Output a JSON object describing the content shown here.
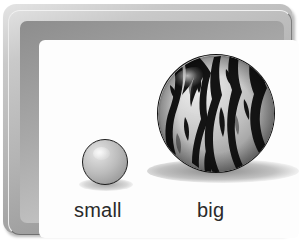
{
  "card": {
    "title": "size comparison card",
    "frame_color": "#b4b4b4",
    "canvas_color": "#fdfdfd"
  },
  "items": [
    {
      "id": "small-ball",
      "label": "small",
      "object_name": "plain grey ball",
      "fill_color": "#bcbcbc",
      "outline_color": "#1d1d1d",
      "diameter_px": 46
    },
    {
      "id": "big-ball",
      "label": "big",
      "object_name": "watermelon striped ball",
      "fill_color": "#b9b9b9",
      "stripe_color": "#1a1a1a",
      "outline_color": "#111111",
      "diameter_px": 118
    }
  ]
}
